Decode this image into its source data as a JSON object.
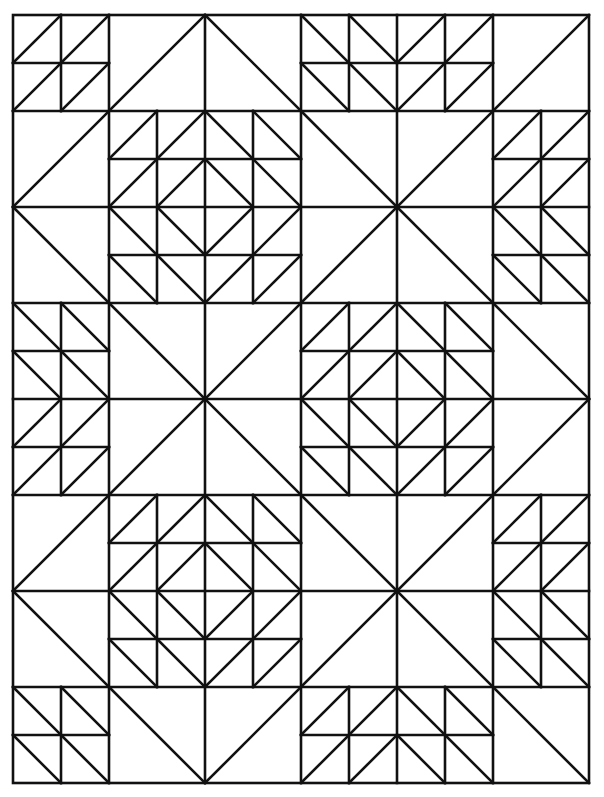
{
  "page": {
    "background": "#ffffff",
    "line_color": "#111111"
  },
  "grid": {
    "origin": [
      13,
      15
    ],
    "cell": 96,
    "cols": 6,
    "rows": 8,
    "note": "Each cell is either a single diagonal ('/' or '\\'), a 2x2 set of quarter squares with diagonals, part of a large X block (2x2 cells), or part of a diamond block (2x2 cells made of 4x4 quarter squares)."
  },
  "cells": [
    {
      "c": 0,
      "r": 0,
      "type": "quarters",
      "diag": [
        [
          "/",
          "/"
        ],
        [
          "/",
          "/"
        ]
      ]
    },
    {
      "c": 1,
      "r": 0,
      "type": "single",
      "diag": "/"
    },
    {
      "c": 2,
      "r": 0,
      "type": "single",
      "diag": "\\"
    },
    {
      "c": 3,
      "r": 0,
      "type": "quarters",
      "diag": [
        [
          "\\",
          "\\"
        ],
        [
          "\\",
          "\\"
        ]
      ]
    },
    {
      "c": 4,
      "r": 0,
      "type": "quarters",
      "diag": [
        [
          "/",
          "/"
        ],
        [
          "/",
          "/"
        ]
      ]
    },
    {
      "c": 5,
      "r": 0,
      "type": "single",
      "diag": "/"
    },
    {
      "c": 0,
      "r": 1,
      "type": "single",
      "diag": "/"
    },
    {
      "c": 0,
      "r": 2,
      "type": "single",
      "diag": "\\"
    },
    {
      "c": 5,
      "r": 1,
      "type": "quarters",
      "diag": [
        [
          "/",
          "/"
        ],
        [
          "/",
          "/"
        ]
      ]
    },
    {
      "c": 5,
      "r": 2,
      "type": "quarters",
      "diag": [
        [
          "\\",
          "\\"
        ],
        [
          "\\",
          "\\"
        ]
      ]
    },
    {
      "c": 0,
      "r": 3,
      "type": "quarters",
      "diag": [
        [
          "\\",
          "\\"
        ],
        [
          "\\",
          "\\"
        ]
      ]
    },
    {
      "c": 0,
      "r": 4,
      "type": "quarters",
      "diag": [
        [
          "/",
          "/"
        ],
        [
          "/",
          "/"
        ]
      ]
    },
    {
      "c": 5,
      "r": 3,
      "type": "single",
      "diag": "\\"
    },
    {
      "c": 5,
      "r": 4,
      "type": "single",
      "diag": "/"
    },
    {
      "c": 0,
      "r": 5,
      "type": "single",
      "diag": "/"
    },
    {
      "c": 0,
      "r": 6,
      "type": "single",
      "diag": "\\"
    },
    {
      "c": 5,
      "r": 5,
      "type": "quarters",
      "diag": [
        [
          "/",
          "/"
        ],
        [
          "/",
          "/"
        ]
      ]
    },
    {
      "c": 5,
      "r": 6,
      "type": "quarters",
      "diag": [
        [
          "\\",
          "\\"
        ],
        [
          "\\",
          "\\"
        ]
      ]
    },
    {
      "c": 0,
      "r": 7,
      "type": "quarters",
      "diag": [
        [
          "\\",
          "\\"
        ],
        [
          "\\",
          "\\"
        ]
      ]
    },
    {
      "c": 1,
      "r": 7,
      "type": "single",
      "diag": "\\"
    },
    {
      "c": 2,
      "r": 7,
      "type": "single",
      "diag": "/"
    },
    {
      "c": 3,
      "r": 7,
      "type": "quarters",
      "diag": [
        [
          "/",
          "/"
        ],
        [
          "/",
          "/"
        ]
      ]
    },
    {
      "c": 4,
      "r": 7,
      "type": "quarters",
      "diag": [
        [
          "\\",
          "\\"
        ],
        [
          "\\",
          "\\"
        ]
      ]
    },
    {
      "c": 5,
      "r": 7,
      "type": "single",
      "diag": "\\"
    }
  ],
  "big_blocks": [
    {
      "c": 1,
      "r": 1,
      "type": "diamond"
    },
    {
      "c": 3,
      "r": 1,
      "type": "x"
    },
    {
      "c": 1,
      "r": 3,
      "type": "x"
    },
    {
      "c": 3,
      "r": 3,
      "type": "diamond"
    },
    {
      "c": 1,
      "r": 5,
      "type": "diamond"
    },
    {
      "c": 3,
      "r": 5,
      "type": "x"
    }
  ]
}
